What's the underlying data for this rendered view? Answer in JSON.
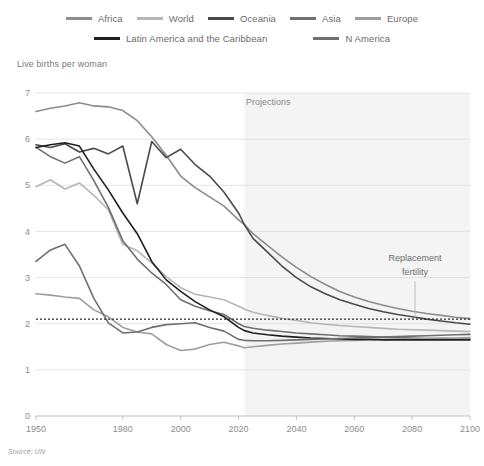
{
  "chart_data": {
    "type": "line",
    "title": "",
    "ylabel": "Live births per woman",
    "xlabel": "",
    "xlim": [
      1950,
      2100
    ],
    "ylim": [
      0,
      7
    ],
    "grid": true,
    "legend_position": "top",
    "source": "Source: UN",
    "annotations": [
      {
        "text": "Projections",
        "x": 2022,
        "y": 6.75
      },
      {
        "text": "Replacement",
        "x": 2081,
        "y": 3.35
      },
      {
        "text": "fertility",
        "x": 2081,
        "y": 3.05
      }
    ],
    "reference_lines": [
      {
        "name": "replacement-fertility",
        "y": 2.1,
        "style": "dotted",
        "color": "#2b2b2b"
      }
    ],
    "projection_start": 2022,
    "xticks": [
      1950,
      1980,
      2000,
      2020,
      2040,
      2060,
      2080,
      2100
    ],
    "yticks": [
      0,
      1,
      2,
      3,
      4,
      5,
      6,
      7
    ],
    "x": [
      1950,
      1955,
      1960,
      1965,
      1970,
      1975,
      1980,
      1985,
      1990,
      1995,
      2000,
      2005,
      2010,
      2015,
      2020,
      2022,
      2025,
      2030,
      2035,
      2040,
      2045,
      2050,
      2055,
      2060,
      2065,
      2070,
      2075,
      2080,
      2085,
      2090,
      2095,
      2100
    ],
    "series": [
      {
        "name": "Africa",
        "color": "#8c8c8c",
        "width": 1.8,
        "values": [
          6.6,
          6.67,
          6.72,
          6.79,
          6.72,
          6.7,
          6.62,
          6.4,
          6.05,
          5.65,
          5.2,
          4.95,
          4.75,
          4.55,
          4.25,
          4.15,
          3.95,
          3.7,
          3.45,
          3.22,
          3.02,
          2.85,
          2.7,
          2.58,
          2.48,
          2.4,
          2.33,
          2.27,
          2.22,
          2.18,
          2.14,
          2.11
        ]
      },
      {
        "name": "World",
        "color": "#b6b6b6",
        "width": 1.8,
        "values": [
          4.97,
          5.12,
          4.92,
          5.05,
          4.78,
          4.47,
          3.72,
          3.58,
          3.32,
          3.02,
          2.78,
          2.64,
          2.58,
          2.52,
          2.38,
          2.32,
          2.25,
          2.18,
          2.12,
          2.07,
          2.02,
          1.99,
          1.96,
          1.94,
          1.92,
          1.9,
          1.88,
          1.87,
          1.86,
          1.85,
          1.84,
          1.83
        ]
      },
      {
        "name": "Oceania",
        "color": "#4a4a4a",
        "width": 1.6,
        "values": [
          5.88,
          5.82,
          5.9,
          5.72,
          5.8,
          5.68,
          5.85,
          4.6,
          5.95,
          5.6,
          5.78,
          5.45,
          5.2,
          4.85,
          4.4,
          4.15,
          3.85,
          3.55,
          3.25,
          3.0,
          2.8,
          2.65,
          2.52,
          2.42,
          2.33,
          2.26,
          2.2,
          2.15,
          2.1,
          2.06,
          2.02,
          1.99
        ]
      },
      {
        "name": "Asia",
        "color": "#6f6f6f",
        "width": 1.8,
        "values": [
          5.82,
          5.62,
          5.48,
          5.62,
          5.1,
          4.52,
          3.8,
          3.4,
          3.1,
          2.85,
          2.52,
          2.38,
          2.28,
          2.2,
          2.0,
          1.94,
          1.9,
          1.86,
          1.83,
          1.8,
          1.78,
          1.76,
          1.74,
          1.73,
          1.72,
          1.71,
          1.7,
          1.69,
          1.68,
          1.68,
          1.67,
          1.67
        ]
      },
      {
        "name": "Europe",
        "color": "#9e9e9e",
        "width": 1.8,
        "values": [
          2.65,
          2.62,
          2.58,
          2.55,
          2.3,
          2.15,
          1.92,
          1.82,
          1.78,
          1.55,
          1.42,
          1.45,
          1.55,
          1.6,
          1.52,
          1.48,
          1.5,
          1.53,
          1.56,
          1.58,
          1.6,
          1.62,
          1.63,
          1.64,
          1.65,
          1.66,
          1.67,
          1.68,
          1.68,
          1.69,
          1.69,
          1.7
        ]
      },
      {
        "name": "Latin America and the Caribbean",
        "color": "#1f1f1f",
        "width": 1.9,
        "values": [
          5.82,
          5.88,
          5.92,
          5.85,
          5.35,
          4.9,
          4.4,
          3.95,
          3.35,
          2.95,
          2.7,
          2.48,
          2.3,
          2.15,
          1.92,
          1.85,
          1.8,
          1.76,
          1.73,
          1.71,
          1.69,
          1.68,
          1.67,
          1.66,
          1.66,
          1.65,
          1.65,
          1.65,
          1.65,
          1.65,
          1.65,
          1.65
        ]
      },
      {
        "name": "N America",
        "color": "#6f6f6f",
        "width": 1.8,
        "values": [
          3.35,
          3.6,
          3.72,
          3.25,
          2.55,
          2.02,
          1.8,
          1.82,
          1.92,
          1.98,
          2.0,
          2.02,
          1.92,
          1.84,
          1.66,
          1.64,
          1.63,
          1.63,
          1.64,
          1.65,
          1.66,
          1.67,
          1.68,
          1.69,
          1.7,
          1.71,
          1.72,
          1.73,
          1.74,
          1.75,
          1.76,
          1.77
        ]
      }
    ]
  },
  "legend": {
    "rows": [
      [
        {
          "label": "Africa",
          "color": "#8c8c8c"
        },
        {
          "label": "World",
          "color": "#b6b6b6"
        },
        {
          "label": "Oceania",
          "color": "#4a4a4a"
        },
        {
          "label": "Asia",
          "color": "#6f6f6f"
        },
        {
          "label": "Europe",
          "color": "#9e9e9e"
        }
      ],
      [
        {
          "label": "Latin America and the Caribbean",
          "color": "#1f1f1f"
        },
        {
          "label": "N America",
          "color": "#6f6f6f"
        }
      ]
    ]
  },
  "axis_title": "Live births per woman",
  "source_note": "Source: UN"
}
